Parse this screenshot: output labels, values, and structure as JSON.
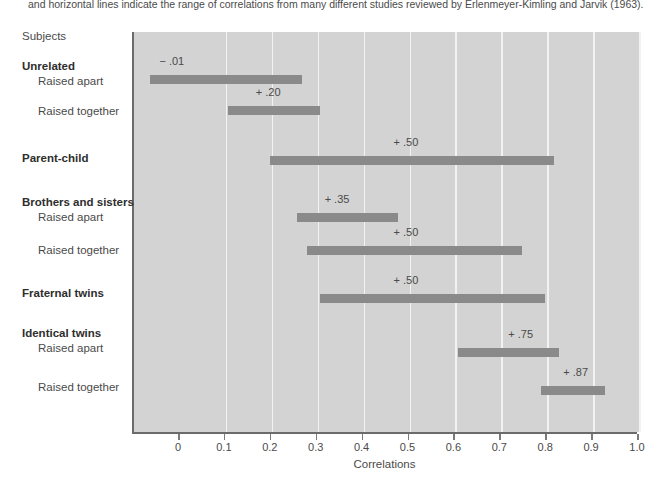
{
  "caption": "and horizontal lines indicate the range of correlations from many different studies reviewed by Erlenmeyer-Kimling and Jarvik (1963).",
  "subjects_header": "Subjects",
  "chart_data": {
    "type": "bar",
    "orientation": "horizontal",
    "title": "",
    "xlabel": "Correlations",
    "ylabel": "Subjects",
    "xlim": [
      -0.075,
      1.0
    ],
    "xticks": [
      "0",
      "0.1",
      "0.2",
      "0.3",
      "0.4",
      "0.5",
      "0.6",
      "0.7",
      "0.8",
      "0.9",
      "1.0"
    ],
    "xtick_values": [
      0,
      0.1,
      0.2,
      0.3,
      0.4,
      0.5,
      0.6,
      0.7,
      0.8,
      0.9,
      1.0
    ],
    "grid": true,
    "legend": "none",
    "plot_background": "#d3d3d3",
    "bar_color": "#8a8a8a",
    "groups": [
      {
        "group_label": "Unrelated",
        "rows": [
          {
            "label": "Raised apart",
            "median_label": "− .01",
            "median": -0.01,
            "range_start": -0.06,
            "range_end": 0.27
          },
          {
            "label": "Raised together",
            "median_label": "+ .20",
            "median": 0.2,
            "range_start": 0.11,
            "range_end": 0.31
          }
        ]
      },
      {
        "group_label": "Parent-child",
        "rows": [
          {
            "label": "",
            "median_label": "+ .50",
            "median": 0.5,
            "range_start": 0.2,
            "range_end": 0.82
          }
        ]
      },
      {
        "group_label": "Brothers and sisters",
        "rows": [
          {
            "label": "Raised apart",
            "median_label": "+ .35",
            "median": 0.35,
            "range_start": 0.26,
            "range_end": 0.48
          },
          {
            "label": "Raised together",
            "median_label": "+ .50",
            "median": 0.5,
            "range_start": 0.28,
            "range_end": 0.75
          }
        ]
      },
      {
        "group_label": "Fraternal twins",
        "rows": [
          {
            "label": "",
            "median_label": "+ .50",
            "median": 0.5,
            "range_start": 0.31,
            "range_end": 0.8
          }
        ]
      },
      {
        "group_label": "Identical twins",
        "rows": [
          {
            "label": "Raised apart",
            "median_label": "+ .75",
            "median": 0.75,
            "range_start": 0.61,
            "range_end": 0.83
          },
          {
            "label": "Raised together",
            "median_label": "+ .87",
            "median": 0.87,
            "range_start": 0.79,
            "range_end": 0.93
          }
        ]
      }
    ]
  },
  "left_labels": [
    {
      "text": "Subjects",
      "bold": false,
      "indent": false,
      "top": 30
    },
    {
      "text": "Unrelated",
      "bold": true,
      "indent": false,
      "top": 60
    },
    {
      "text": "Raised apart",
      "bold": false,
      "indent": true,
      "top": 75
    },
    {
      "text": "Raised together",
      "bold": false,
      "indent": true,
      "top": 105
    },
    {
      "text": "Parent-child",
      "bold": true,
      "indent": false,
      "top": 152
    },
    {
      "text": "Brothers and sisters",
      "bold": true,
      "indent": false,
      "top": 196
    },
    {
      "text": "Raised apart",
      "bold": false,
      "indent": true,
      "top": 211
    },
    {
      "text": "Raised together",
      "bold": false,
      "indent": true,
      "top": 244
    },
    {
      "text": "Fraternal twins",
      "bold": true,
      "indent": false,
      "top": 287
    },
    {
      "text": "Identical twins",
      "bold": true,
      "indent": false,
      "top": 327
    },
    {
      "text": "Raised apart",
      "bold": false,
      "indent": true,
      "top": 342
    },
    {
      "text": "Raised together",
      "bold": false,
      "indent": true,
      "top": 381
    }
  ],
  "bar_rows": [
    {
      "key": "unrelated-raised-apart",
      "top": 75,
      "label_top": 55,
      "start": -0.06,
      "end": 0.27,
      "label": "− .01",
      "label_at": -0.01
    },
    {
      "key": "unrelated-raised-together",
      "top": 106,
      "label_top": 86,
      "start": 0.11,
      "end": 0.31,
      "label": "+ .20",
      "label_at": 0.2
    },
    {
      "key": "parent-child",
      "top": 156,
      "label_top": 136,
      "start": 0.2,
      "end": 0.82,
      "label": "+ .50",
      "label_at": 0.5
    },
    {
      "key": "siblings-raised-apart",
      "top": 213,
      "label_top": 193,
      "start": 0.26,
      "end": 0.48,
      "label": "+ .35",
      "label_at": 0.35
    },
    {
      "key": "siblings-raised-together",
      "top": 246,
      "label_top": 226,
      "start": 0.28,
      "end": 0.75,
      "label": "+ .50",
      "label_at": 0.5
    },
    {
      "key": "fraternal-twins",
      "top": 294,
      "label_top": 274,
      "start": 0.31,
      "end": 0.8,
      "label": "+ .50",
      "label_at": 0.5
    },
    {
      "key": "identical-twins-raised-apart",
      "top": 348,
      "label_top": 328,
      "start": 0.61,
      "end": 0.83,
      "label": "+ .75",
      "label_at": 0.75
    },
    {
      "key": "identical-twins-raised-together",
      "top": 386,
      "label_top": 366,
      "start": 0.79,
      "end": 0.93,
      "label": "+ .87",
      "label_at": 0.87
    }
  ],
  "axis": {
    "title": "Correlations",
    "ticks": [
      "0",
      "0.1",
      "0.2",
      "0.3",
      "0.4",
      "0.5",
      "0.6",
      "0.7",
      "0.8",
      "0.9",
      "1.0"
    ]
  }
}
